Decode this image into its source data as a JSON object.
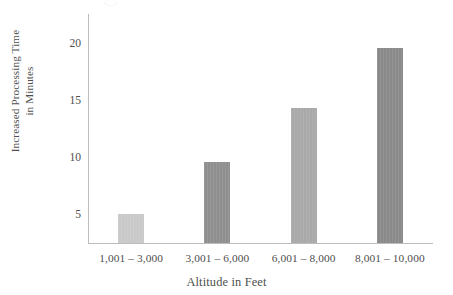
{
  "chart_data": {
    "type": "bar",
    "title": "",
    "subtitle": "",
    "xlabel": "Altitude in Feet",
    "ylabel": "Increased Processing Time in Minutes",
    "ylabel_lines": [
      "Increased Processing Time",
      "in Minutes"
    ],
    "categories": [
      "1,001 – 3,000",
      "3,001 – 6,000",
      "6,001 – 8,000",
      "8,001 – 10,000"
    ],
    "values": [
      4.9,
      9.5,
      14.2,
      19.4
    ],
    "bar_colors": [
      "#c9c9c9",
      "#8f8f8f",
      "#a9a9a9",
      "#8a8a8a"
    ],
    "ytick_labels": [
      "20",
      "15",
      "10",
      "5"
    ],
    "ytick_values": [
      20,
      15,
      10,
      5
    ],
    "ylim": [
      2.4,
      22.5
    ],
    "grid": false,
    "legend": null,
    "axis_color": "#bdbdbd",
    "text_color": "#4f4f4f"
  },
  "figure": {
    "background": "#ffffff",
    "width": 453,
    "height": 295
  }
}
